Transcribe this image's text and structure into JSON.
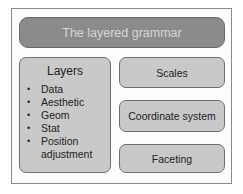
{
  "diagram": {
    "title": "The layered grammar",
    "layers": {
      "heading": "Layers",
      "items": [
        "Data",
        "Aesthetic",
        "Geom",
        "Stat",
        "Position adjustment"
      ]
    },
    "components": [
      "Scales",
      "Coordinate system",
      "Faceting"
    ],
    "colors": {
      "title_fill": "#8b8b8b",
      "title_text": "#d6d6d6",
      "box_fill": "#c9c9c9",
      "border": "#6f6f6f"
    }
  }
}
